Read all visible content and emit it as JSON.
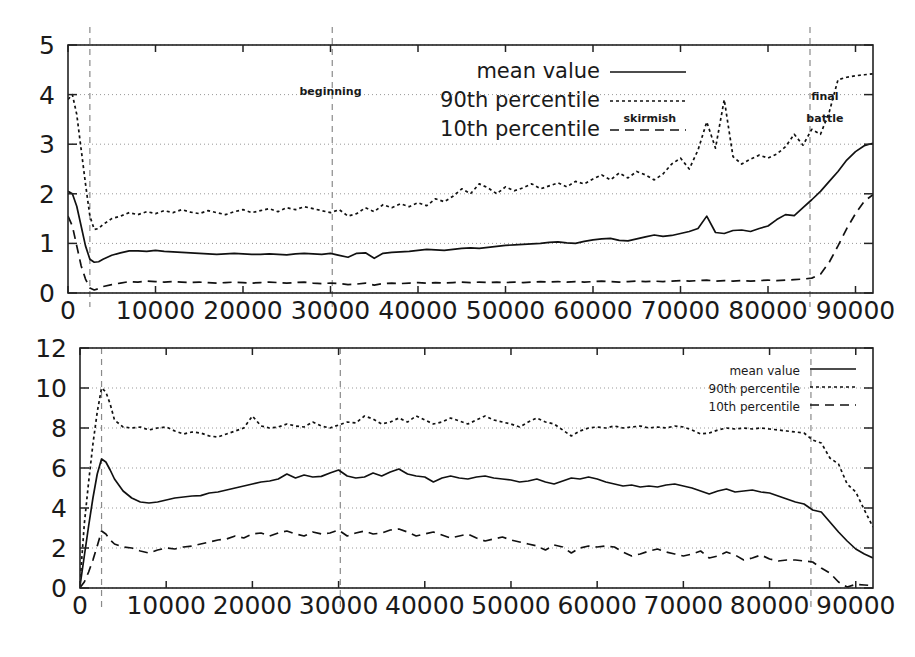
{
  "chart_data": [
    {
      "id": "top",
      "type": "line",
      "title": "",
      "xlabel": "",
      "ylabel": "",
      "xlim": [
        0,
        92000
      ],
      "ylim": [
        0,
        5
      ],
      "xticks": [
        0,
        10000,
        20000,
        30000,
        40000,
        50000,
        60000,
        70000,
        80000,
        90000
      ],
      "xticklabels": [
        "0",
        "10000",
        "20000",
        "30000",
        "40000",
        "50000",
        "60000",
        "70000",
        "80000",
        "90000"
      ],
      "yticks": [
        0,
        1,
        2,
        3,
        4,
        5
      ],
      "yticklabels": [
        "0",
        "1",
        "2",
        "3",
        "4",
        "5"
      ],
      "grid": true,
      "legend_position": "upper center",
      "annotations": [
        {
          "text": "beginning",
          "x": 30000,
          "y": 4.0
        },
        {
          "text": "skirmish",
          "x": 66500,
          "y": 3.45
        },
        {
          "text": "final battle",
          "x": 86500,
          "y": 3.9
        }
      ],
      "event_lines": [
        {
          "x": 2500,
          "label": "beginning"
        },
        {
          "x": 30200,
          "label": "skirmish"
        },
        {
          "x": 84800,
          "label": "final battle"
        }
      ],
      "x": [
        0,
        500,
        1000,
        1500,
        2000,
        2500,
        3000,
        3500,
        4000,
        5000,
        6000,
        7000,
        8000,
        9000,
        10000,
        11000,
        12000,
        13000,
        14000,
        15000,
        16000,
        17000,
        18000,
        19000,
        20000,
        21000,
        22000,
        23000,
        24000,
        25000,
        26000,
        27000,
        28000,
        29000,
        30000,
        31000,
        32000,
        33000,
        34000,
        35000,
        36000,
        37000,
        38000,
        39000,
        40000,
        41000,
        42000,
        43000,
        44000,
        45000,
        46000,
        47000,
        48000,
        49000,
        50000,
        51000,
        52000,
        53000,
        54000,
        55000,
        56000,
        57000,
        58000,
        59000,
        60000,
        61000,
        62000,
        63000,
        64000,
        65000,
        66000,
        67000,
        68000,
        69000,
        70000,
        71000,
        72000,
        73000,
        74000,
        75000,
        76000,
        77000,
        78000,
        79000,
        80000,
        81000,
        82000,
        83000,
        84000,
        85000,
        86000,
        87000,
        88000,
        89000,
        90000,
        91000,
        92000
      ],
      "series": [
        {
          "name": "mean value",
          "style": "solid",
          "values": [
            2.05,
            2.0,
            1.75,
            1.35,
            0.95,
            0.68,
            0.62,
            0.63,
            0.68,
            0.76,
            0.81,
            0.85,
            0.85,
            0.84,
            0.86,
            0.84,
            0.83,
            0.82,
            0.81,
            0.8,
            0.79,
            0.78,
            0.79,
            0.8,
            0.79,
            0.78,
            0.78,
            0.79,
            0.78,
            0.77,
            0.79,
            0.8,
            0.79,
            0.78,
            0.8,
            0.76,
            0.72,
            0.8,
            0.81,
            0.7,
            0.8,
            0.82,
            0.83,
            0.84,
            0.86,
            0.88,
            0.87,
            0.86,
            0.88,
            0.9,
            0.91,
            0.9,
            0.92,
            0.94,
            0.96,
            0.97,
            0.98,
            0.99,
            1.0,
            1.02,
            1.03,
            1.01,
            1.0,
            1.04,
            1.07,
            1.09,
            1.1,
            1.06,
            1.05,
            1.09,
            1.13,
            1.17,
            1.14,
            1.16,
            1.2,
            1.24,
            1.3,
            1.55,
            1.22,
            1.2,
            1.26,
            1.27,
            1.24,
            1.3,
            1.35,
            1.48,
            1.58,
            1.56,
            1.72,
            1.88,
            2.05,
            2.25,
            2.45,
            2.68,
            2.85,
            2.97,
            3.02
          ]
        },
        {
          "name": "90th percentile",
          "style": "dotted",
          "values": [
            3.9,
            4.0,
            3.6,
            2.9,
            2.2,
            1.55,
            1.28,
            1.3,
            1.38,
            1.5,
            1.55,
            1.62,
            1.58,
            1.64,
            1.6,
            1.66,
            1.62,
            1.68,
            1.63,
            1.6,
            1.66,
            1.62,
            1.58,
            1.64,
            1.68,
            1.62,
            1.66,
            1.7,
            1.64,
            1.72,
            1.68,
            1.74,
            1.7,
            1.66,
            1.62,
            1.68,
            1.55,
            1.6,
            1.72,
            1.64,
            1.78,
            1.72,
            1.8,
            1.74,
            1.82,
            1.76,
            1.9,
            1.84,
            1.95,
            2.1,
            2.0,
            2.2,
            2.12,
            2.0,
            2.14,
            2.06,
            2.12,
            2.2,
            2.1,
            2.16,
            2.22,
            2.14,
            2.25,
            2.2,
            2.3,
            2.38,
            2.28,
            2.42,
            2.32,
            2.45,
            2.38,
            2.28,
            2.4,
            2.6,
            2.72,
            2.5,
            2.88,
            3.45,
            2.92,
            3.9,
            2.75,
            2.6,
            2.7,
            2.78,
            2.72,
            2.8,
            2.95,
            3.2,
            2.98,
            3.3,
            3.2,
            3.65,
            4.3,
            4.35,
            4.38,
            4.4,
            4.42
          ]
        },
        {
          "name": "10th percentile",
          "style": "dashed",
          "values": [
            1.55,
            1.35,
            0.95,
            0.55,
            0.28,
            0.1,
            0.06,
            0.09,
            0.13,
            0.17,
            0.2,
            0.23,
            0.22,
            0.24,
            0.23,
            0.22,
            0.23,
            0.22,
            0.21,
            0.22,
            0.21,
            0.2,
            0.21,
            0.22,
            0.21,
            0.2,
            0.21,
            0.22,
            0.21,
            0.2,
            0.21,
            0.22,
            0.2,
            0.19,
            0.2,
            0.19,
            0.17,
            0.18,
            0.2,
            0.16,
            0.19,
            0.2,
            0.19,
            0.2,
            0.21,
            0.2,
            0.21,
            0.2,
            0.21,
            0.22,
            0.21,
            0.22,
            0.21,
            0.22,
            0.21,
            0.22,
            0.21,
            0.22,
            0.23,
            0.22,
            0.23,
            0.22,
            0.23,
            0.22,
            0.23,
            0.24,
            0.23,
            0.22,
            0.23,
            0.24,
            0.23,
            0.24,
            0.23,
            0.24,
            0.25,
            0.24,
            0.25,
            0.26,
            0.24,
            0.25,
            0.24,
            0.25,
            0.24,
            0.25,
            0.26,
            0.25,
            0.26,
            0.27,
            0.28,
            0.3,
            0.38,
            0.62,
            0.95,
            1.3,
            1.6,
            1.85,
            1.98
          ]
        }
      ]
    },
    {
      "id": "bottom",
      "type": "line",
      "title": "",
      "xlabel": "",
      "ylabel": "",
      "xlim": [
        0,
        92000
      ],
      "ylim": [
        0,
        12
      ],
      "xticks": [
        0,
        10000,
        20000,
        30000,
        40000,
        50000,
        60000,
        70000,
        80000,
        90000
      ],
      "xticklabels": [
        "0",
        "10000",
        "20000",
        "30000",
        "40000",
        "50000",
        "60000",
        "70000",
        "80000",
        "90000"
      ],
      "yticks": [
        0,
        2,
        4,
        6,
        8,
        10,
        12
      ],
      "yticklabels": [
        "0",
        "2",
        "4",
        "6",
        "8",
        "10",
        "12"
      ],
      "grid": true,
      "legend_position": "upper right",
      "annotations": [],
      "event_lines": [
        {
          "x": 2500,
          "label": "beginning"
        },
        {
          "x": 30200,
          "label": "skirmish"
        },
        {
          "x": 84800,
          "label": "final battle"
        }
      ],
      "x": [
        0,
        500,
        1000,
        1500,
        2000,
        2500,
        3000,
        3500,
        4000,
        5000,
        6000,
        7000,
        8000,
        9000,
        10000,
        11000,
        12000,
        13000,
        14000,
        15000,
        16000,
        17000,
        18000,
        19000,
        20000,
        21000,
        22000,
        23000,
        24000,
        25000,
        26000,
        27000,
        28000,
        29000,
        30000,
        31000,
        32000,
        33000,
        34000,
        35000,
        36000,
        37000,
        38000,
        39000,
        40000,
        41000,
        42000,
        43000,
        44000,
        45000,
        46000,
        47000,
        48000,
        49000,
        50000,
        51000,
        52000,
        53000,
        54000,
        55000,
        56000,
        57000,
        58000,
        59000,
        60000,
        61000,
        62000,
        63000,
        64000,
        65000,
        66000,
        67000,
        68000,
        69000,
        70000,
        71000,
        72000,
        73000,
        74000,
        75000,
        76000,
        77000,
        78000,
        79000,
        80000,
        81000,
        82000,
        83000,
        84000,
        85000,
        86000,
        87000,
        88000,
        89000,
        90000,
        91000,
        92000
      ],
      "series": [
        {
          "name": "mean value",
          "style": "solid",
          "values": [
            0.1,
            1.6,
            3.1,
            4.5,
            5.7,
            6.45,
            6.3,
            5.9,
            5.45,
            4.85,
            4.5,
            4.3,
            4.25,
            4.3,
            4.4,
            4.5,
            4.55,
            4.6,
            4.62,
            4.75,
            4.8,
            4.9,
            5.0,
            5.1,
            5.2,
            5.3,
            5.35,
            5.45,
            5.7,
            5.5,
            5.65,
            5.55,
            5.58,
            5.75,
            5.9,
            5.6,
            5.5,
            5.55,
            5.75,
            5.6,
            5.8,
            5.95,
            5.7,
            5.6,
            5.55,
            5.3,
            5.5,
            5.6,
            5.5,
            5.45,
            5.55,
            5.6,
            5.5,
            5.45,
            5.4,
            5.3,
            5.35,
            5.45,
            5.3,
            5.2,
            5.35,
            5.5,
            5.45,
            5.55,
            5.45,
            5.3,
            5.2,
            5.1,
            5.15,
            5.05,
            5.1,
            5.05,
            5.15,
            5.2,
            5.1,
            5.0,
            4.85,
            4.7,
            4.85,
            4.95,
            4.8,
            4.85,
            4.9,
            4.8,
            4.75,
            4.6,
            4.45,
            4.3,
            4.2,
            3.9,
            3.8,
            3.3,
            2.8,
            2.35,
            1.95,
            1.7,
            1.5
          ]
        },
        {
          "name": "90th percentile",
          "style": "dotted",
          "values": [
            0.25,
            3.2,
            5.3,
            7.2,
            8.8,
            10.0,
            9.8,
            9.2,
            8.4,
            8.05,
            8.0,
            8.05,
            7.9,
            8.0,
            8.05,
            7.85,
            7.7,
            7.8,
            7.75,
            7.6,
            7.55,
            7.7,
            7.85,
            8.0,
            8.6,
            8.1,
            8.0,
            8.05,
            8.2,
            8.1,
            8.05,
            8.3,
            8.1,
            8.0,
            8.15,
            8.3,
            8.25,
            8.6,
            8.45,
            8.2,
            8.3,
            8.5,
            8.3,
            8.6,
            8.4,
            8.2,
            8.3,
            8.5,
            8.35,
            8.2,
            8.4,
            8.6,
            8.4,
            8.3,
            8.2,
            8.05,
            8.3,
            8.5,
            8.3,
            8.2,
            7.9,
            7.6,
            7.85,
            8.0,
            8.05,
            8.0,
            8.1,
            8.0,
            8.05,
            8.1,
            8.0,
            8.05,
            8.0,
            8.1,
            8.05,
            7.9,
            7.7,
            7.75,
            7.9,
            8.0,
            7.95,
            8.0,
            7.95,
            8.0,
            7.95,
            7.9,
            7.85,
            7.8,
            7.75,
            7.4,
            7.25,
            6.5,
            6.2,
            5.2,
            4.8,
            3.9,
            3.05
          ]
        },
        {
          "name": "10th percentile",
          "style": "dashed",
          "values": [
            0.02,
            0.3,
            0.8,
            1.4,
            2.1,
            2.85,
            2.7,
            2.4,
            2.2,
            2.05,
            2.0,
            1.85,
            1.75,
            1.9,
            2.0,
            1.95,
            2.05,
            2.1,
            2.2,
            2.3,
            2.4,
            2.45,
            2.6,
            2.5,
            2.7,
            2.75,
            2.6,
            2.75,
            2.85,
            2.7,
            2.6,
            2.8,
            2.7,
            2.75,
            2.9,
            2.6,
            2.75,
            2.85,
            2.7,
            2.75,
            2.9,
            2.95,
            2.8,
            2.6,
            2.7,
            2.8,
            2.65,
            2.5,
            2.6,
            2.7,
            2.5,
            2.35,
            2.45,
            2.55,
            2.4,
            2.3,
            2.2,
            2.1,
            1.9,
            2.15,
            2.05,
            1.75,
            2.0,
            2.1,
            2.05,
            2.1,
            2.05,
            1.8,
            1.6,
            1.7,
            1.85,
            1.95,
            1.8,
            1.7,
            1.6,
            1.7,
            1.85,
            1.5,
            1.6,
            1.8,
            1.65,
            1.4,
            1.5,
            1.65,
            1.45,
            1.35,
            1.4,
            1.4,
            1.35,
            1.3,
            1.0,
            0.75,
            0.3,
            0.05,
            0.18,
            0.15,
            0.12
          ]
        }
      ]
    }
  ],
  "legends": {
    "top": [
      {
        "label": "mean value",
        "style": "solid"
      },
      {
        "label": "90th percentile",
        "style": "dotted"
      },
      {
        "label": "10th percentile",
        "style": "dashed"
      }
    ],
    "bottom": [
      {
        "label": "mean value",
        "style": "solid"
      },
      {
        "label": "90th percentile",
        "style": "dotted"
      },
      {
        "label": "10th percentile",
        "style": "dashed"
      }
    ]
  },
  "annotations": {
    "beginning": "beginning",
    "skirmish": "skirmish",
    "final_battle_line1": "final",
    "final_battle_line2": "battle"
  },
  "colors": {
    "line": "#111111",
    "frame": "#222222",
    "grid": "#999999",
    "event": "#8a8a8a",
    "background": "#ffffff"
  }
}
